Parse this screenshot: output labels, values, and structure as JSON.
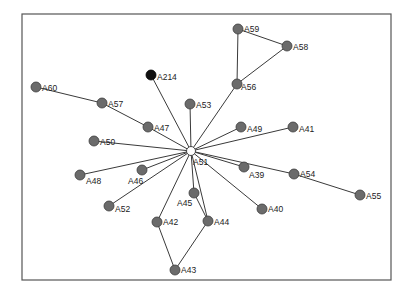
{
  "diagram": {
    "type": "network-graph",
    "frame": {
      "x": 22,
      "y": 14,
      "width": 369,
      "height": 266
    },
    "colors": {
      "node": "#6b6b6b",
      "hub": "#ffffff",
      "highlight": "#111111",
      "edge": "#3a3a3a"
    },
    "nodes": [
      {
        "id": "A51",
        "x": 191,
        "y": 151,
        "label": "A51",
        "lx": 193,
        "ly": 162,
        "style": "hub"
      },
      {
        "id": "A214",
        "x": 151,
        "y": 75,
        "label": "A214",
        "lx": 157,
        "ly": 77,
        "style": "dark"
      },
      {
        "id": "A60",
        "x": 36,
        "y": 87,
        "label": "A60",
        "lx": 42,
        "ly": 88,
        "style": "normal"
      },
      {
        "id": "A57",
        "x": 102,
        "y": 103,
        "label": "A57",
        "lx": 108,
        "ly": 104,
        "style": "normal"
      },
      {
        "id": "A47",
        "x": 148,
        "y": 127,
        "label": "A47",
        "lx": 154,
        "ly": 128,
        "style": "normal"
      },
      {
        "id": "A53",
        "x": 190,
        "y": 104,
        "label": "A53",
        "lx": 196,
        "ly": 105,
        "style": "normal"
      },
      {
        "id": "A50",
        "x": 94,
        "y": 141,
        "label": "A50",
        "lx": 100,
        "ly": 142,
        "style": "normal"
      },
      {
        "id": "A48",
        "x": 80,
        "y": 175,
        "label": "A48",
        "lx": 86,
        "ly": 181,
        "style": "normal"
      },
      {
        "id": "A46",
        "x": 142,
        "y": 170,
        "label": "A46",
        "lx": 128,
        "ly": 181,
        "style": "normal"
      },
      {
        "id": "A52",
        "x": 109,
        "y": 206,
        "label": "A52",
        "lx": 115,
        "ly": 209,
        "style": "normal"
      },
      {
        "id": "A42",
        "x": 157,
        "y": 222,
        "label": "A42",
        "lx": 163,
        "ly": 222,
        "style": "normal"
      },
      {
        "id": "A43",
        "x": 175,
        "y": 270,
        "label": "A43",
        "lx": 181,
        "ly": 270,
        "style": "normal"
      },
      {
        "id": "A45",
        "x": 194,
        "y": 193,
        "label": "A45",
        "lx": 177,
        "ly": 203,
        "style": "normal"
      },
      {
        "id": "A44",
        "x": 208,
        "y": 221,
        "label": "A44",
        "lx": 214,
        "ly": 222,
        "style": "normal"
      },
      {
        "id": "A49",
        "x": 241,
        "y": 127,
        "label": "A49",
        "lx": 247,
        "ly": 129,
        "style": "normal"
      },
      {
        "id": "A41",
        "x": 293,
        "y": 127,
        "label": "A41",
        "lx": 299,
        "ly": 129,
        "style": "normal"
      },
      {
        "id": "A39",
        "x": 244,
        "y": 167,
        "label": "A39",
        "lx": 249,
        "ly": 175,
        "style": "normal"
      },
      {
        "id": "A54",
        "x": 294,
        "y": 174,
        "label": "A54",
        "lx": 300,
        "ly": 174,
        "style": "normal"
      },
      {
        "id": "A55",
        "x": 360,
        "y": 195,
        "label": "A55",
        "lx": 366,
        "ly": 196,
        "style": "normal"
      },
      {
        "id": "A40",
        "x": 262,
        "y": 209,
        "label": "A40",
        "lx": 268,
        "ly": 209,
        "style": "normal"
      },
      {
        "id": "A56",
        "x": 237,
        "y": 84,
        "label": "A56",
        "lx": 241,
        "ly": 87,
        "style": "normal"
      },
      {
        "id": "A59",
        "x": 238,
        "y": 29,
        "label": "A59",
        "lx": 244,
        "ly": 29,
        "style": "normal"
      },
      {
        "id": "A58",
        "x": 287,
        "y": 46,
        "label": "A58",
        "lx": 293,
        "ly": 47,
        "style": "normal"
      }
    ],
    "edges": [
      [
        "A51",
        "A214"
      ],
      [
        "A51",
        "A47"
      ],
      [
        "A47",
        "A57"
      ],
      [
        "A57",
        "A60"
      ],
      [
        "A51",
        "A53"
      ],
      [
        "A51",
        "A50"
      ],
      [
        "A51",
        "A48"
      ],
      [
        "A51",
        "A46"
      ],
      [
        "A51",
        "A52"
      ],
      [
        "A51",
        "A42"
      ],
      [
        "A42",
        "A43"
      ],
      [
        "A43",
        "A44"
      ],
      [
        "A51",
        "A45"
      ],
      [
        "A45",
        "A44"
      ],
      [
        "A51",
        "A44"
      ],
      [
        "A51",
        "A49"
      ],
      [
        "A51",
        "A41"
      ],
      [
        "A51",
        "A39"
      ],
      [
        "A51",
        "A54"
      ],
      [
        "A54",
        "A55"
      ],
      [
        "A51",
        "A40"
      ],
      [
        "A51",
        "A56"
      ],
      [
        "A56",
        "A59"
      ],
      [
        "A59",
        "A58"
      ],
      [
        "A58",
        "A56"
      ]
    ]
  }
}
